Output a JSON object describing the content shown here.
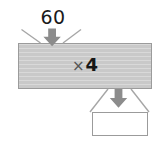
{
  "diagram": {
    "kind": "function-machine-bar-model",
    "input": {
      "label": "60",
      "arrow": "down-arrow-icon"
    },
    "operation": {
      "symbol": "×",
      "operand": "4",
      "fill_color": "#c9c9c9",
      "border_color": "#9b9b9b"
    },
    "output": {
      "label": "",
      "arrow": "down-arrow-icon",
      "fill_color": "#ffffff",
      "border_color": "#9b9b9b"
    },
    "arrow_color": "#8c8c8c",
    "guide_line_color": "#a6a6a6",
    "text_color": "#1b1b1b"
  }
}
